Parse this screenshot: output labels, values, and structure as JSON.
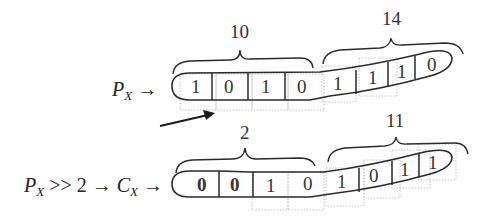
{
  "row1": {
    "label_main": "P",
    "label_sub": "X",
    "arrow": "→",
    "bits": [
      "1",
      "0",
      "1",
      "0",
      "1",
      "1",
      "1",
      "0"
    ],
    "group_left_value": "10",
    "group_right_value": "14"
  },
  "row2": {
    "label_main": "P",
    "label_sub": "X",
    "shift_op": ">> 2",
    "arrow1": "→",
    "result_main": "C",
    "result_sub": "X",
    "arrow2": "→",
    "bits": [
      "0",
      "0",
      "1",
      "0",
      "1",
      "0",
      "1",
      "1"
    ],
    "bold_bits": [
      0,
      1
    ],
    "group_left_value": "2",
    "group_right_value": "11"
  },
  "colors": {
    "stroke": "#2a2a2a",
    "ghost": "#bdbdbd"
  }
}
